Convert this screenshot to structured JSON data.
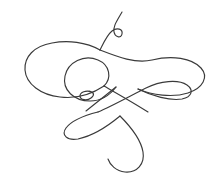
{
  "artwork": {
    "title": "Calligraphic Flourish",
    "kind": "decorative-line-ornament",
    "canvas": {
      "width": 218,
      "height": 188
    },
    "background_color": "#ffffff",
    "ink_color": "#3a3a3a",
    "stroke_width": 1.15,
    "description": "Single continuous pen-drawn ornamental flourish with symmetric butterfly-like wing loops, a small circular eyelet at top, a tiny eyelet at center-left, and a long descending hook tail at bottom.",
    "strokes": [
      {
        "name": "upper-tail-and-eyelet",
        "d": "M122 12 C 117 21 113 26 114 32 C 115 37 121 39 122 34 C 123 29 117 27 112 31 C 107 35 104 42 100 50"
      },
      {
        "name": "left-wing-outer",
        "d": "M100 50 C 86 42 68 40 52 43 C 34 46 24 57 25 70 C 26 84 41 95 60 97 C 76 99 92 94 104 86"
      },
      {
        "name": "left-inner-loop",
        "d": "M104 86 C 112 78 110 65 98 60 C 84 54 68 62 65 76 C 62 90 74 101 90 101 C 101 101 110 95 116 87"
      },
      {
        "name": "center-eyelet",
        "d": "M92 92 C 86 90 80 92 80 96 C 80 100 87 101 91 98 C 95 95 94 92 89 91"
      },
      {
        "name": "right-wing-upper",
        "d": "M100 50 C 118 57 136 64 152 60 C 172 55 192 58 201 68 C 209 77 203 88 188 93 C 172 98 152 95 138 89"
      },
      {
        "name": "right-wing-lower",
        "d": "M138 89 C 152 96 170 101 182 99 C 192 97 194 90 187 85 C 178 79 160 81 146 88 C 130 96 112 106 98 112"
      },
      {
        "name": "bottom-leaf-loop",
        "d": "M98 112 C 86 115 72 120 66 128 C 61 135 67 141 78 139 C 92 136 108 126 120 116"
      },
      {
        "name": "descending-hook",
        "d": "M120 116 C 130 126 141 140 143 152 C 145 164 137 173 125 172 C 116 171 110 165 108 159"
      },
      {
        "name": "connector-diagonal-a",
        "d": "M104 86 C 118 94 134 103 148 112"
      },
      {
        "name": "connector-diagonal-b",
        "d": "M116 87 C 106 95 96 103 86 111"
      }
    ]
  }
}
